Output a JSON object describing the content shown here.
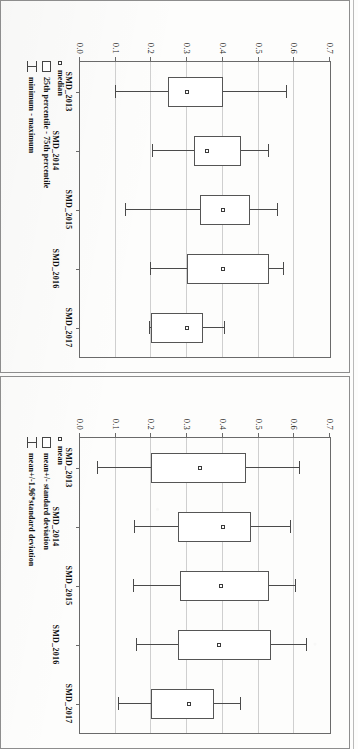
{
  "figure": {
    "orientation_note": "scanned page, figure rotated 90 degrees clockwise",
    "panel_count": 2
  },
  "chart_data": [
    {
      "type": "bar",
      "subtype": "box",
      "panel_id": "panel-top",
      "title": "",
      "xlabel": "",
      "ylabel": "",
      "ylim": [
        0.0,
        0.7
      ],
      "yticks": [
        "0.0",
        "0.1",
        "0.2",
        "0.3",
        "0.4",
        "0.5",
        "0.6",
        "0.7"
      ],
      "ytick_values": [
        0.0,
        0.1,
        0.2,
        0.3,
        0.4,
        0.5,
        0.6,
        0.7
      ],
      "grid": true,
      "legend_position": "below-left",
      "categories": [
        "SMD_2013",
        "SMD_2014",
        "SMD_2015",
        "SMD_2016",
        "SMD_2017"
      ],
      "legend": [
        {
          "marker": "small-square",
          "label": "mean"
        },
        {
          "marker": "open-box",
          "label": "mean+/- standard deviation"
        },
        {
          "marker": "whisker-bar",
          "label": "mean+/-1.96*standard deviation"
        }
      ],
      "boxes": [
        {
          "category": "SMD_2013",
          "mean": 0.335,
          "box_low": 0.2,
          "box_high": 0.465,
          "whisk_low": 0.05,
          "whisk_high": 0.615
        },
        {
          "category": "SMD_2014",
          "mean": 0.4,
          "box_low": 0.275,
          "box_high": 0.48,
          "whisk_low": 0.155,
          "whisk_high": 0.59
        },
        {
          "category": "SMD_2015",
          "mean": 0.395,
          "box_low": 0.28,
          "box_high": 0.53,
          "whisk_low": 0.15,
          "whisk_high": 0.605
        },
        {
          "category": "SMD_2016",
          "mean": 0.39,
          "box_low": 0.275,
          "box_high": 0.535,
          "whisk_low": 0.16,
          "whisk_high": 0.635
        },
        {
          "category": "SMD_2017",
          "mean": 0.305,
          "box_low": 0.2,
          "box_high": 0.375,
          "whisk_low": 0.11,
          "whisk_high": 0.45
        }
      ]
    },
    {
      "type": "bar",
      "subtype": "box",
      "panel_id": "panel-bottom",
      "title": "",
      "xlabel": "",
      "ylabel": "",
      "ylim": [
        0.0,
        0.7
      ],
      "yticks": [
        "0.0",
        "0.1",
        "0.2",
        "0.3",
        "0.4",
        "0.5",
        "0.6",
        "0.7"
      ],
      "ytick_values": [
        0.0,
        0.1,
        0.2,
        0.3,
        0.4,
        0.5,
        0.6,
        0.7
      ],
      "grid": true,
      "legend_position": "below-left",
      "categories": [
        "SMD_2013",
        "SMD_2014",
        "SMD_2015",
        "SMD_2016",
        "SMD_2017"
      ],
      "legend": [
        {
          "marker": "small-square",
          "label": "median"
        },
        {
          "marker": "open-box",
          "label": "25th percentile - 75th percentile"
        },
        {
          "marker": "whisker-bar",
          "label": "minimum - maximum"
        }
      ],
      "boxes": [
        {
          "category": "SMD_2013",
          "mean": 0.3,
          "box_low": 0.245,
          "box_high": 0.4,
          "whisk_low": 0.1,
          "whisk_high": 0.58
        },
        {
          "category": "SMD_2014",
          "mean": 0.355,
          "box_low": 0.32,
          "box_high": 0.45,
          "whisk_low": 0.205,
          "whisk_high": 0.53
        },
        {
          "category": "SMD_2015",
          "mean": 0.4,
          "box_low": 0.335,
          "box_high": 0.475,
          "whisk_low": 0.13,
          "whisk_high": 0.555
        },
        {
          "category": "SMD_2016",
          "mean": 0.4,
          "box_low": 0.3,
          "box_high": 0.53,
          "whisk_low": 0.2,
          "whisk_high": 0.57
        },
        {
          "category": "SMD_2017",
          "mean": 0.3,
          "box_low": 0.2,
          "box_high": 0.345,
          "whisk_low": 0.195,
          "whisk_high": 0.405
        }
      ]
    }
  ],
  "colors": {
    "panel_border": "#8d8d8d",
    "axis": "#6a6a6a",
    "grid": "#cfcfcf",
    "box_line": "#555555",
    "text": "#111111",
    "page": "#fdfdfc"
  }
}
